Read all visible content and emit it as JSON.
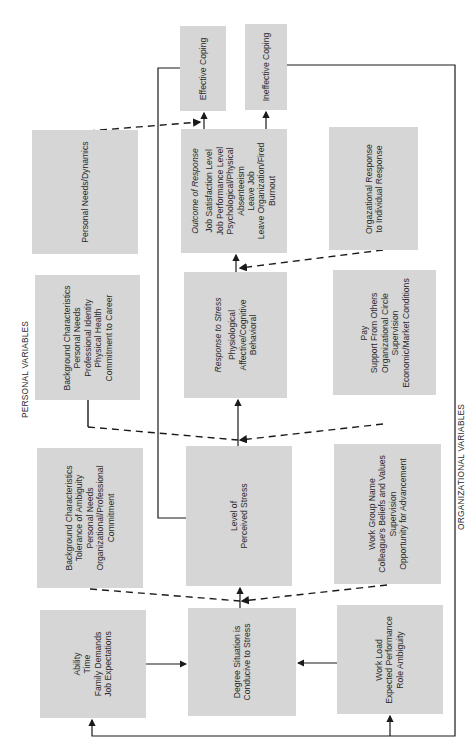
{
  "diagram": {
    "orientation": "rotated -90deg",
    "box_color": "#d6d6d6",
    "line_color": "#1a1a1a",
    "section_labels": {
      "personal": "PERSONAL VARIABLES",
      "organizational": "ORGANIZATIONAL VARIABLES"
    },
    "outcomes": {
      "effective": "Effective Coping",
      "ineffective": "Ineffective Coping"
    },
    "personal_column": {
      "needs_dynamics": {
        "lines": [
          "Personal Needs/Dynamics"
        ]
      },
      "career": {
        "lines": [
          "Background Characteristics",
          "Personal Needs",
          "Professional Identity",
          "Physical Health",
          "Commitment to Career"
        ]
      },
      "ambiguity": {
        "lines": [
          "Background Characteristics",
          "Tolerance of Ambiguity",
          "Personal Needs",
          "Organizational/Professional",
          "Commitment"
        ]
      },
      "ability": {
        "lines": [
          "Ability",
          "Time",
          "Family Demands",
          "Job Expectations"
        ]
      }
    },
    "central_column": {
      "outcome": {
        "title": "Outcome of Response",
        "lines": [
          "Job Satisfaction Level",
          "Job Performance Level",
          "Psychological/Physical",
          "Absenteeism",
          "Leave Job",
          "Leave Organization/Fired",
          "Burnout"
        ]
      },
      "response": {
        "title": "Response to Stress",
        "lines": [
          "Physiological",
          "Affective/Cognitive",
          "Behavioral"
        ]
      },
      "perceived": {
        "lines": [
          "Level of",
          "Perceived Stress"
        ]
      },
      "degree": {
        "lines": [
          "Degree Situation is",
          "Conducive to Stress"
        ]
      }
    },
    "organizational_column": {
      "org_response": {
        "lines": [
          "Orgazational Response",
          "to Individual Response"
        ]
      },
      "pay": {
        "lines": [
          "Pay",
          "Support From Others",
          "Organizational Circle",
          "Supervision",
          "Economic/Market Conditions"
        ]
      },
      "work_group": {
        "lines": [
          "Work Group Name",
          "Colleague's Beliefs and Values",
          "Supervision",
          "Opportunity for Advancement"
        ]
      },
      "work_load": {
        "lines": [
          "Work Load",
          "Expected Performance",
          "Role Ambiguity"
        ]
      }
    }
  }
}
